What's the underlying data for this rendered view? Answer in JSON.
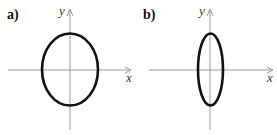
{
  "panels": [
    {
      "label": "a)",
      "x_axis_label": "x",
      "y_axis_label": "y",
      "shape": "ellipse",
      "description": "Ellipse centered at origin, slightly taller than wide"
    },
    {
      "label": "b)",
      "x_axis_label": "x",
      "y_axis_label": "y",
      "shape": "ellipse",
      "description": "Narrow ellipse centered at origin, much taller than wide"
    }
  ],
  "colors": {
    "curve": "#111111",
    "axis": "#999999"
  }
}
